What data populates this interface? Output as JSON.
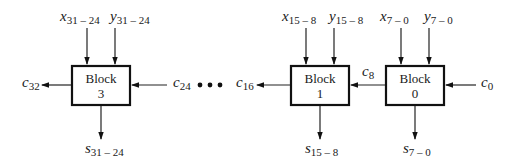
{
  "diagram": {
    "blocks": [
      {
        "id": "block3",
        "label": "Block",
        "number": "3"
      },
      {
        "id": "block1",
        "label": "Block",
        "number": "1"
      },
      {
        "id": "block0",
        "label": "Block",
        "number": "0"
      }
    ],
    "inputs": {
      "x31_24": {
        "var": "x",
        "sub": "31 – 24"
      },
      "y31_24": {
        "var": "y",
        "sub": "31 – 24"
      },
      "x15_8": {
        "var": "x",
        "sub": "15 – 8"
      },
      "y15_8": {
        "var": "y",
        "sub": "15 – 8"
      },
      "x7_0": {
        "var": "x",
        "sub": "7 – 0"
      },
      "y7_0": {
        "var": "y",
        "sub": "7 – 0"
      }
    },
    "outputs": {
      "s31_24": {
        "var": "s",
        "sub": "31 – 24"
      },
      "s15_8": {
        "var": "s",
        "sub": "15 – 8"
      },
      "s7_0": {
        "var": "s",
        "sub": "7 – 0"
      }
    },
    "carries": {
      "c32": {
        "var": "c",
        "sub": "32"
      },
      "c24": {
        "var": "c",
        "sub": "24"
      },
      "c16": {
        "var": "c",
        "sub": "16"
      },
      "c8": {
        "var": "c",
        "sub": "8"
      },
      "c0": {
        "var": "c",
        "sub": "0"
      }
    },
    "ellipsis": "• • •",
    "colors": {
      "line": "#222222",
      "box_border": "#111111",
      "background": "#ffffff"
    }
  }
}
